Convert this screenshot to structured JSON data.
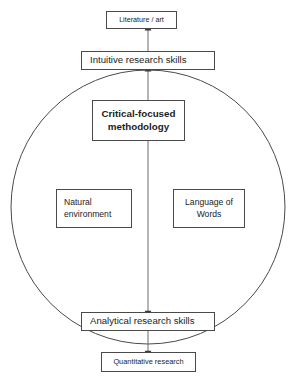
{
  "diagram": {
    "canvas": {
      "width": 299,
      "height": 386,
      "background": "#ffffff"
    },
    "stroke_color": "#4a4a4a",
    "text_color": "#1c1c1c",
    "boundary": {
      "shape": "circle",
      "name": "methodology-boundary-circle",
      "center_x": 148,
      "center_y": 207,
      "radius": 137
    },
    "nodes": [
      {
        "id": "literature",
        "label": "Literature / art",
        "emphasis": "normal",
        "inside_circle": false
      },
      {
        "id": "intuitive",
        "label": "Intuitive research skills",
        "emphasis": "normal",
        "inside_circle": false
      },
      {
        "id": "methodology",
        "label_line1": "Critical-focused",
        "label_line2": "methodology",
        "emphasis": "bold",
        "inside_circle": true
      },
      {
        "id": "natural",
        "label_line1": "Natural",
        "label_line2": "environment",
        "emphasis": "normal",
        "inside_circle": true
      },
      {
        "id": "language",
        "label_line1": "Language of",
        "label_line2": "Words",
        "emphasis": "normal",
        "inside_circle": true
      },
      {
        "id": "analytical",
        "label": "Analytical research skills",
        "emphasis": "normal",
        "inside_circle": false
      },
      {
        "id": "quantitative",
        "label": "Quantitative research",
        "emphasis": "normal",
        "inside_circle": false
      }
    ],
    "connectors": [
      {
        "id": "methodology-to-intuitive",
        "from": "methodology",
        "to": "intuitive",
        "direction": "up",
        "arrowhead": "filled-triangle"
      },
      {
        "id": "intuitive-to-literature",
        "from": "intuitive",
        "to": "literature",
        "direction": "up",
        "arrowhead": "filled-triangle"
      },
      {
        "id": "methodology-to-analytical",
        "from": "methodology",
        "to": "analytical",
        "direction": "down",
        "arrowhead": "filled-triangle"
      },
      {
        "id": "analytical-to-quantitative",
        "from": "analytical",
        "to": "quantitative",
        "direction": "down",
        "arrowhead": "filled-triangle"
      }
    ]
  }
}
